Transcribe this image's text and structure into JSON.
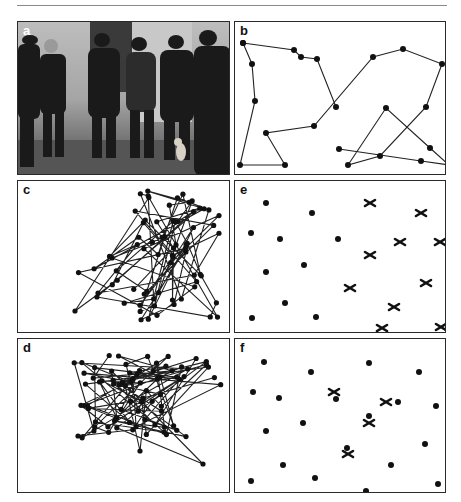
{
  "figure": {
    "panels": [
      {
        "id": "a",
        "label": "a",
        "kind": "photograph",
        "description": "Black-and-white photo of a group of men in dark coats standing by a wall, with a small dog at their feet"
      },
      {
        "id": "b",
        "label": "b",
        "kind": "path-plot",
        "description": "Short tour connecting 22 points"
      },
      {
        "id": "c",
        "label": "c",
        "kind": "path-plot",
        "description": "Dense tangled tour clustered to the right"
      },
      {
        "id": "d",
        "label": "d",
        "kind": "path-plot",
        "description": "Dense tangled tour clustered across the top"
      },
      {
        "id": "e",
        "label": "e",
        "kind": "point-plot",
        "description": "Dots and crossed-out (X) markers"
      },
      {
        "id": "f",
        "label": "f",
        "kind": "point-plot",
        "description": "Dots with some X markers overlapping dots"
      }
    ]
  },
  "chart_data": [
    {
      "panel": "b",
      "type": "line",
      "title": "",
      "xlabel": "",
      "ylabel": "",
      "grid": false,
      "path": [
        [
          -4,
          19
        ],
        [
          5,
          40
        ],
        [
          8,
          77
        ],
        [
          -7,
          141
        ],
        [
          38,
          141
        ],
        [
          19,
          109
        ],
        [
          67,
          102
        ],
        [
          126,
          33
        ],
        [
          156,
          25
        ],
        [
          195,
          40
        ],
        [
          179,
          83
        ],
        [
          133,
          132
        ],
        [
          101,
          141
        ],
        [
          139,
          84
        ],
        [
          183,
          124
        ],
        [
          202,
          141
        ],
        [
          174,
          137
        ],
        [
          92,
          125
        ]
      ],
      "branch": [
        [
          -4,
          19
        ],
        [
          47,
          26
        ],
        [
          54,
          33
        ],
        [
          70,
          35
        ],
        [
          89,
          83
        ]
      ]
    },
    {
      "panel": "e",
      "type": "scatter",
      "dots": [
        [
          26,
          17
        ],
        [
          72,
          27
        ],
        [
          11,
          47
        ],
        [
          40,
          53
        ],
        [
          98,
          53
        ],
        [
          64,
          79
        ],
        [
          26,
          86
        ],
        [
          45,
          117
        ],
        [
          12,
          132
        ],
        [
          76,
          131
        ]
      ],
      "crosses": [
        [
          130,
          17
        ],
        [
          181,
          27
        ],
        [
          160,
          56
        ],
        [
          200,
          56
        ],
        [
          130,
          69
        ],
        [
          110,
          102
        ],
        [
          186,
          97
        ],
        [
          154,
          121
        ],
        [
          142,
          142
        ],
        [
          201,
          141
        ]
      ]
    },
    {
      "panel": "f",
      "type": "scatter",
      "dots": [
        [
          24,
          18
        ],
        [
          71,
          28
        ],
        [
          129,
          19
        ],
        [
          179,
          28
        ],
        [
          13,
          48
        ],
        [
          39,
          54
        ],
        [
          196,
          62
        ],
        [
          26,
          87
        ],
        [
          63,
          79
        ],
        [
          96,
          55
        ],
        [
          158,
          58
        ],
        [
          129,
          72
        ],
        [
          107,
          104
        ],
        [
          185,
          100
        ],
        [
          43,
          121
        ],
        [
          151,
          121
        ],
        [
          75,
          134
        ],
        [
          11,
          137
        ],
        [
          126,
          147
        ],
        [
          198,
          140
        ]
      ],
      "crosses": [
        [
          94,
          48
        ],
        [
          146,
          58
        ],
        [
          129,
          79
        ],
        [
          108,
          110
        ]
      ]
    }
  ]
}
